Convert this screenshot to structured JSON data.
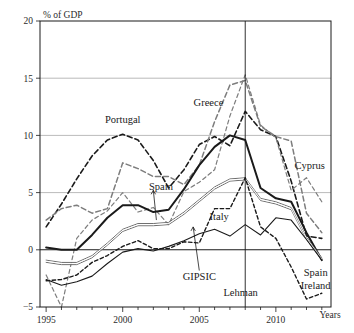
{
  "chart_data": {
    "type": "line",
    "title": "",
    "xlabel": "Years",
    "ylabel": "% of GDP",
    "xlim": [
      1994.6,
      2013.6
    ],
    "ylim": [
      -5,
      20
    ],
    "grid": true,
    "legend_position": "inline-annotations",
    "xticks": [
      1995,
      2000,
      2005,
      2010
    ],
    "xtick_labels": [
      "1995",
      "2000",
      "2005",
      "2010"
    ],
    "xminor_step": 1,
    "yticks": [
      -5,
      0,
      5,
      10,
      15,
      20
    ],
    "ytick_labels": [
      "−5",
      "0",
      "5",
      "10",
      "15",
      "20"
    ],
    "annotations": [
      {
        "text": "Portugal",
        "x": 2000.0,
        "y": 11.1,
        "anchor": "middle"
      },
      {
        "text": "Greece",
        "x": 2005.6,
        "y": 12.6,
        "anchor": "middle"
      },
      {
        "text": "Spain",
        "x": 2002.5,
        "y": 5.2,
        "anchor": "middle"
      },
      {
        "text": "Cyprus",
        "x": 2012.2,
        "y": 7.1,
        "anchor": "middle"
      },
      {
        "text": "Italy",
        "x": 2006.3,
        "y": 2.6,
        "anchor": "middle"
      },
      {
        "text": "GIPSIC",
        "x": 2005.0,
        "y": -2.6,
        "anchor": "middle"
      },
      {
        "text": "Lehman",
        "x": 2007.7,
        "y": -4.0,
        "anchor": "middle"
      },
      {
        "text": "Spain",
        "x": 2012.6,
        "y": -2.3,
        "anchor": "middle"
      },
      {
        "text": "Ireland",
        "x": 2012.6,
        "y": -3.4,
        "anchor": "middle"
      }
    ],
    "event_markers": [
      {
        "label": "Lehman",
        "x": 2008.0
      }
    ],
    "series": [
      {
        "name": "Portugal",
        "style": "dashed",
        "color": "#1a1a1a",
        "width": 1.6,
        "dash": "5,3",
        "x": [
          1995,
          1996,
          1997,
          1998,
          1999,
          2000,
          2001,
          2002,
          2003,
          2004,
          2005,
          2006,
          2007,
          2008,
          2009,
          2010,
          2011,
          2012,
          2013
        ],
        "values": [
          2.0,
          4.0,
          6.2,
          8.2,
          9.6,
          10.1,
          9.6,
          7.8,
          5.4,
          7.0,
          9.2,
          9.9,
          9.1,
          12.1,
          10.5,
          9.9,
          6.0,
          1.2,
          1.0
        ]
      },
      {
        "name": "Greece",
        "style": "dashed-gray",
        "color": "#7d7d7d",
        "width": 1.5,
        "dash": "5,3",
        "x": [
          1995,
          1996,
          1997,
          1998,
          1999,
          2000,
          2001,
          2002,
          2003,
          2004,
          2005,
          2006,
          2007,
          2008,
          2009,
          2010,
          2011,
          2012,
          2013
        ],
        "values": [
          2.6,
          3.6,
          3.9,
          3.2,
          3.6,
          7.6,
          7.1,
          6.4,
          6.4,
          5.7,
          7.4,
          11.2,
          14.4,
          14.8,
          10.8,
          9.9,
          9.5,
          3.2,
          1.5
        ]
      },
      {
        "name": "Cyprus",
        "style": "dashed-gray-thin",
        "color": "#7d7d7d",
        "width": 1.2,
        "dash": "4,3",
        "x": [
          1995,
          1996,
          1997,
          1998,
          1999,
          2000,
          2001,
          2002,
          2003,
          2004,
          2005,
          2006,
          2007,
          2008,
          2009,
          2010,
          2011,
          2012,
          2013
        ],
        "values": [
          -2.2,
          -5.0,
          1.0,
          2.6,
          3.4,
          5.0,
          3.3,
          3.7,
          2.2,
          5.1,
          5.9,
          7.0,
          11.7,
          15.3,
          10.9,
          9.8,
          5.2,
          6.3,
          4.2
        ]
      },
      {
        "name": "Spain",
        "style": "solid-thick",
        "color": "#1a1a1a",
        "width": 2.0,
        "dash": "",
        "x": [
          1995,
          1996,
          1997,
          1998,
          1999,
          2000,
          2001,
          2002,
          2003,
          2004,
          2005,
          2006,
          2007,
          2008,
          2009,
          2010,
          2011,
          2012,
          2013
        ],
        "values": [
          0.2,
          0.0,
          0.0,
          1.3,
          2.8,
          3.9,
          3.9,
          3.3,
          3.5,
          5.3,
          7.4,
          9.0,
          10.0,
          9.6,
          5.4,
          4.5,
          4.2,
          1.5,
          -0.9
        ]
      },
      {
        "name": "GIPSIC",
        "style": "solid-double-gray",
        "color": "#6e6e6e",
        "width": 1.7,
        "dash": "",
        "x": [
          1995,
          1996,
          1997,
          1998,
          1999,
          2000,
          2001,
          2002,
          2003,
          2004,
          2005,
          2006,
          2007,
          2008,
          2009,
          2010,
          2011,
          2012,
          2013
        ],
        "values": [
          -1.0,
          -1.2,
          -1.2,
          -0.6,
          0.5,
          1.7,
          2.2,
          2.2,
          2.3,
          3.2,
          4.3,
          5.4,
          6.1,
          6.2,
          4.4,
          4.1,
          3.6,
          1.0,
          -0.8
        ]
      },
      {
        "name": "Italy",
        "style": "solid-thin",
        "color": "#1a1a1a",
        "width": 1.1,
        "dash": "",
        "x": [
          1995,
          1996,
          1997,
          1998,
          1999,
          2000,
          2001,
          2002,
          2003,
          2004,
          2005,
          2006,
          2007,
          2008,
          2009,
          2010,
          2011,
          2012,
          2013
        ],
        "values": [
          -2.6,
          -3.1,
          -2.8,
          -2.3,
          -1.2,
          -0.2,
          0.1,
          -0.1,
          0.3,
          0.8,
          1.4,
          1.8,
          1.2,
          2.2,
          1.3,
          2.8,
          2.6,
          0.9,
          -0.9
        ]
      },
      {
        "name": "Ireland",
        "style": "dashed-short",
        "color": "#1a1a1a",
        "width": 1.4,
        "dash": "3.5,2.5",
        "x": [
          1995,
          1996,
          1997,
          1998,
          1999,
          2000,
          2001,
          2002,
          2003,
          2004,
          2005,
          2006,
          2007,
          2008,
          2009,
          2010,
          2011,
          2012,
          2013
        ],
        "values": [
          -2.7,
          -2.6,
          -2.2,
          -1.1,
          -0.5,
          0.3,
          0.8,
          0.1,
          0.1,
          0.7,
          0.6,
          3.6,
          3.6,
          6.3,
          2.0,
          1.0,
          -1.5,
          -4.3,
          -3.8
        ]
      }
    ]
  },
  "axis": {
    "y_title": "% of GDP",
    "x_title": "Years"
  }
}
